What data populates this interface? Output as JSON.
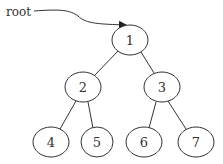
{
  "diagram": {
    "type": "binary-tree",
    "pointer": {
      "label": "root",
      "points_to": "1"
    },
    "nodes": [
      {
        "id": "1",
        "label": "1",
        "cx": 130,
        "cy": 40
      },
      {
        "id": "2",
        "label": "2",
        "cx": 83,
        "cy": 87
      },
      {
        "id": "3",
        "label": "3",
        "cx": 162,
        "cy": 87
      },
      {
        "id": "4",
        "label": "4",
        "cx": 51,
        "cy": 142
      },
      {
        "id": "5",
        "label": "5",
        "cx": 97,
        "cy": 142
      },
      {
        "id": "6",
        "label": "6",
        "cx": 144,
        "cy": 142
      },
      {
        "id": "7",
        "label": "7",
        "cx": 196,
        "cy": 142
      }
    ],
    "edges": [
      {
        "from": "1",
        "to": "2"
      },
      {
        "from": "1",
        "to": "3"
      },
      {
        "from": "2",
        "to": "4"
      },
      {
        "from": "2",
        "to": "5"
      },
      {
        "from": "3",
        "to": "6"
      },
      {
        "from": "3",
        "to": "7"
      }
    ],
    "colors": {
      "stroke": "#333333",
      "background": "#ffffff"
    }
  }
}
